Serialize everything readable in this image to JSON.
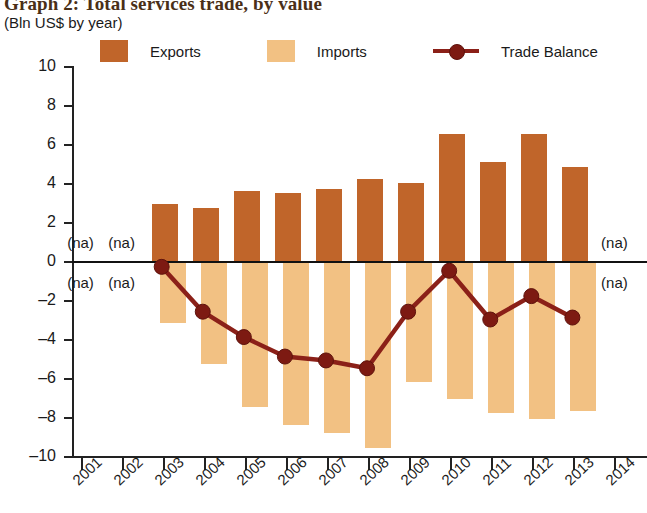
{
  "title": "Graph 2: Total services trade, by value",
  "subtitle": "(Bln US$ by year)",
  "colors": {
    "exports": "#C0652A",
    "imports": "#F2C183",
    "trade_balance": "#8B2018",
    "marker": "#7d1a12",
    "axis": "#222222",
    "title": "#4A2F17"
  },
  "legend": {
    "position": "top",
    "items": [
      {
        "label": "Exports",
        "type": "swatch",
        "color": "#C0652A",
        "icon": "square-swatch-icon"
      },
      {
        "label": "Imports",
        "type": "swatch",
        "color": "#F2C183",
        "icon": "square-swatch-icon"
      },
      {
        "label": "Trade Balance",
        "type": "line",
        "color": "#8B2018",
        "icon": "line-marker-icon"
      }
    ]
  },
  "na_label": "(na)",
  "na_years": [
    "2001",
    "2002",
    "2014"
  ],
  "chart_data": {
    "type": "bar",
    "title": "Graph 2: Total services trade, by value",
    "subtitle": "(Bln US$ by year)",
    "xlabel": "",
    "ylabel": "",
    "ylim": [
      -10,
      10
    ],
    "yticks": [
      10,
      8,
      6,
      4,
      2,
      0,
      -2,
      -4,
      -6,
      -8,
      -10
    ],
    "ytick_labels": [
      "10",
      "8",
      "6",
      "4",
      "2",
      "0",
      "–2",
      "–4",
      "–6",
      "–8",
      "–10"
    ],
    "grid": false,
    "legend_position": "top",
    "categories": [
      "2001",
      "2002",
      "2003",
      "2004",
      "2005",
      "2006",
      "2007",
      "2008",
      "2009",
      "2010",
      "2011",
      "2012",
      "2013",
      "2014"
    ],
    "series": [
      {
        "name": "Exports",
        "type": "bar",
        "color": "#C0652A",
        "values": [
          null,
          null,
          2.9,
          2.7,
          3.6,
          3.5,
          3.7,
          4.2,
          4.0,
          6.5,
          5.1,
          6.5,
          4.8,
          null
        ]
      },
      {
        "name": "Imports",
        "type": "bar",
        "color": "#F2C183",
        "values": [
          null,
          null,
          -3.2,
          -5.3,
          -7.5,
          -8.4,
          -8.8,
          -9.6,
          -6.2,
          -7.1,
          -7.8,
          -8.1,
          -7.7,
          null
        ]
      },
      {
        "name": "Trade Balance",
        "type": "line",
        "color": "#8B2018",
        "values": [
          null,
          null,
          -0.3,
          -2.6,
          -3.9,
          -4.9,
          -5.1,
          -5.5,
          -2.6,
          -0.5,
          -3.0,
          -1.8,
          -2.9,
          null
        ]
      }
    ]
  }
}
